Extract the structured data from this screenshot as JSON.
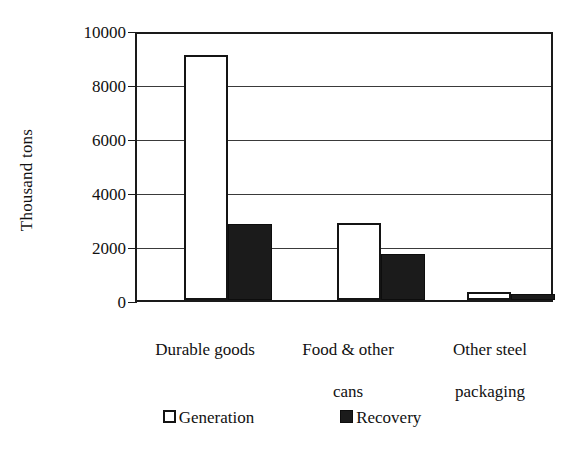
{
  "chart_data": {
    "type": "bar",
    "title": "",
    "subtitle": "",
    "xlabel": "",
    "ylabel": "Thousand tons",
    "ylim": [
      0,
      10000
    ],
    "ytick_values": [
      0,
      2000,
      4000,
      6000,
      8000,
      10000
    ],
    "ytick_labels": [
      "0",
      "2000",
      "4000",
      "6000",
      "8000",
      "10000"
    ],
    "grid": "horizontal",
    "legend_position": "bottom-center",
    "categories": [
      "Durable goods",
      "Food & other cans",
      "Other steel packaging"
    ],
    "series": [
      {
        "name": "Generation",
        "fill": "#ffffff",
        "stroke": "#141414",
        "values": [
          9200,
          2880,
          290
        ]
      },
      {
        "name": "Recovery",
        "fill": "#1b1b1b",
        "stroke": "#0d0d0d",
        "values": [
          2850,
          1740,
          220
        ]
      }
    ]
  },
  "axis": {
    "y_title": "Thousand tons",
    "y_labels": [
      "10000",
      "8000",
      "6000",
      "4000",
      "2000",
      "0"
    ]
  },
  "categories": [
    {
      "line1": "Durable goods",
      "line2": ""
    },
    {
      "line1": "Food & other",
      "line2": "cans"
    },
    {
      "line1": "Other steel",
      "line2": "packaging"
    }
  ],
  "legend": {
    "items": [
      {
        "label": "Generation",
        "swatch": "hollow-square-icon"
      },
      {
        "label": "Recovery",
        "swatch": "filled-square-icon"
      }
    ]
  },
  "colors": {
    "ink": "#111111",
    "bar_outline": "#141414",
    "bar_fill_dark": "#1b1b1b",
    "gridline": "#3a3a3a",
    "background": "#ffffff"
  }
}
